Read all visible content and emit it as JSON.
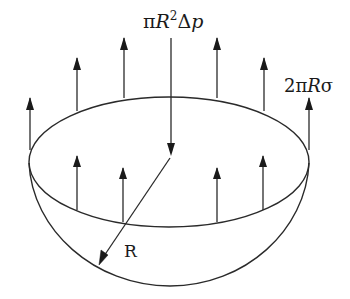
{
  "diagram": {
    "labels": {
      "pressure_force": {
        "pi": "π",
        "R": "R",
        "sup": "2",
        "delta": "Δ",
        "p": "p"
      },
      "tension_force": {
        "two": "2",
        "pi": "π",
        "R": "R",
        "sigma": "σ"
      },
      "radius": "R"
    },
    "colors": {
      "stroke": "#2a2a2a",
      "background": "#ffffff"
    },
    "arrows": {
      "upward_back": [
        30,
        77,
        124,
        217,
        264,
        309
      ],
      "upward_front": [
        77,
        123,
        217,
        263
      ],
      "downward_center": 171
    }
  }
}
